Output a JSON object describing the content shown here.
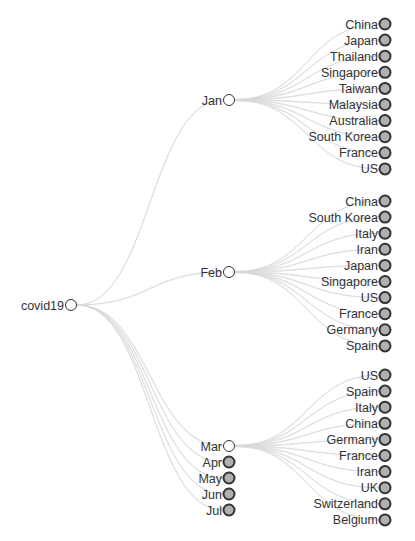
{
  "chart_data": {
    "type": "tree",
    "title": "",
    "root": {
      "name": "covid19",
      "collapsed": false,
      "children": [
        {
          "name": "Jan",
          "collapsed": false,
          "children": [
            "China",
            "Japan",
            "Thailand",
            "Singapore",
            "Taiwan",
            "Malaysia",
            "Australia",
            "South Korea",
            "France",
            "US"
          ]
        },
        {
          "name": "Feb",
          "collapsed": false,
          "children": [
            "China",
            "South Korea",
            "Italy",
            "Iran",
            "Japan",
            "Singapore",
            "US",
            "France",
            "Germany",
            "Spain"
          ]
        },
        {
          "name": "Mar",
          "collapsed": false,
          "children": [
            "US",
            "Spain",
            "Italy",
            "China",
            "Germany",
            "France",
            "Iran",
            "UK",
            "Switzerland",
            "Belgium"
          ]
        },
        {
          "name": "Apr",
          "collapsed": true,
          "children": []
        },
        {
          "name": "May",
          "collapsed": true,
          "children": []
        },
        {
          "name": "Jun",
          "collapsed": true,
          "children": []
        },
        {
          "name": "Jul",
          "collapsed": true,
          "children": []
        }
      ]
    }
  },
  "layout": {
    "root": {
      "x": 71,
      "y": 305
    },
    "months": [
      {
        "x": 229,
        "y": 100
      },
      {
        "x": 229,
        "y": 272
      },
      {
        "x": 229,
        "y": 446
      },
      {
        "x": 229,
        "y": 462
      },
      {
        "x": 229,
        "y": 478
      },
      {
        "x": 229,
        "y": 494
      },
      {
        "x": 229,
        "y": 510
      }
    ],
    "leaf_x": 385,
    "leaf_start_y": [
      24,
      201,
      375
    ],
    "leaf_step": 16.1
  },
  "colors": {
    "link": "#d8d8d8",
    "open_fill": "#ffffff",
    "collapsed_fill": "#b0b0b0",
    "stroke": "#333333",
    "label": "#333333"
  }
}
